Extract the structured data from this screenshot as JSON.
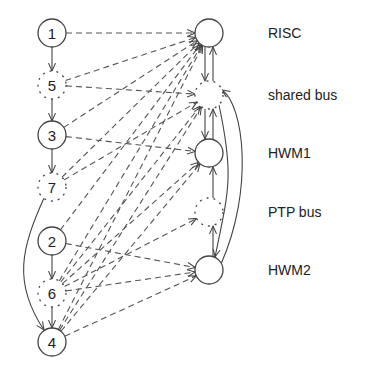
{
  "diagram": {
    "task_nodes": [
      {
        "id": "1",
        "label": "1",
        "x": 52,
        "y": 33,
        "style": "solid"
      },
      {
        "id": "5",
        "label": "5",
        "x": 52,
        "y": 85,
        "style": "dotted"
      },
      {
        "id": "3",
        "label": "3",
        "x": 52,
        "y": 135,
        "style": "solid"
      },
      {
        "id": "7",
        "label": "7",
        "x": 52,
        "y": 187,
        "style": "dotted"
      },
      {
        "id": "2",
        "label": "2",
        "x": 52,
        "y": 241,
        "style": "solid"
      },
      {
        "id": "6",
        "label": "6",
        "x": 52,
        "y": 293,
        "style": "dotted"
      },
      {
        "id": "4",
        "label": "4",
        "x": 52,
        "y": 342,
        "style": "solid"
      }
    ],
    "resource_nodes": [
      {
        "id": "RISC",
        "label": "RISC",
        "x": 209,
        "y": 33,
        "style": "solid"
      },
      {
        "id": "shared_bus",
        "label": "shared bus",
        "x": 209,
        "y": 95,
        "style": "dotted"
      },
      {
        "id": "HWM1",
        "label": "HWM1",
        "x": 209,
        "y": 153,
        "style": "solid"
      },
      {
        "id": "PTP_bus",
        "label": "PTP bus",
        "x": 209,
        "y": 212,
        "style": "dotted"
      },
      {
        "id": "HWM2",
        "label": "HWM2",
        "x": 209,
        "y": 270,
        "style": "solid"
      }
    ],
    "task_edges": [
      {
        "from": "1",
        "to": "5"
      },
      {
        "from": "5",
        "to": "3"
      },
      {
        "from": "3",
        "to": "7"
      },
      {
        "from": "7",
        "to": "4",
        "curved": true
      },
      {
        "from": "2",
        "to": "6"
      },
      {
        "from": "6",
        "to": "4"
      }
    ],
    "mapping_edges": [
      {
        "from": "1",
        "to": "RISC"
      },
      {
        "from": "5",
        "to": "RISC"
      },
      {
        "from": "5",
        "to": "shared_bus"
      },
      {
        "from": "3",
        "to": "RISC"
      },
      {
        "from": "3",
        "to": "HWM1"
      },
      {
        "from": "7",
        "to": "RISC"
      },
      {
        "from": "7",
        "to": "shared_bus"
      },
      {
        "from": "2",
        "to": "RISC"
      },
      {
        "from": "2",
        "to": "HWM2"
      },
      {
        "from": "6",
        "to": "RISC"
      },
      {
        "from": "6",
        "to": "shared_bus"
      },
      {
        "from": "6",
        "to": "HWM1"
      },
      {
        "from": "6",
        "to": "PTP_bus"
      },
      {
        "from": "6",
        "to": "HWM2"
      },
      {
        "from": "4",
        "to": "RISC"
      },
      {
        "from": "4",
        "to": "shared_bus"
      },
      {
        "from": "4",
        "to": "HWM1"
      },
      {
        "from": "4",
        "to": "HWM2"
      }
    ],
    "resource_edges": [
      {
        "from": "RISC",
        "to": "shared_bus"
      },
      {
        "from": "shared_bus",
        "to": "RISC"
      },
      {
        "from": "shared_bus",
        "to": "HWM1"
      },
      {
        "from": "HWM1",
        "to": "shared_bus"
      },
      {
        "from": "HWM2",
        "to": "PTP_bus"
      },
      {
        "from": "PTP_bus",
        "to": "HWM1"
      },
      {
        "from": "shared_bus",
        "to": "HWM2",
        "curved": true
      },
      {
        "from": "HWM2",
        "to": "shared_bus",
        "curved": true
      }
    ],
    "colors": {
      "stroke": "#444444",
      "background": "#ffffff"
    }
  }
}
